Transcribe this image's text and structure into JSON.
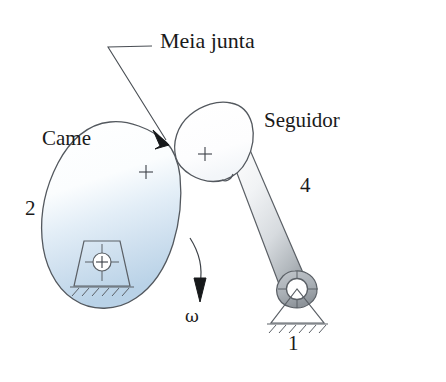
{
  "figure": {
    "background_color": "#ffffff",
    "outline_color": "#555a60",
    "text_color": "#1a1a1a"
  },
  "labels": {
    "half_joint": "Meia junta",
    "cam": "Came",
    "follower": "Seguidor",
    "link_cam_number": "2",
    "link_follower_number": "4",
    "link_ground_number": "1",
    "angular_velocity": "ω"
  },
  "parts": {
    "cam": {
      "name": "Came",
      "link_number": "2",
      "fill_top_color": "#ffffff",
      "fill_bottom_color": "#bcd3e8",
      "center_mark": "+"
    },
    "follower": {
      "name": "Seguidor",
      "link_number": "4",
      "head_fill_color": "#ffffff",
      "arm_fill_top_color": "#f2f4f6",
      "arm_fill_bottom_color": "#9aa0a6",
      "center_mark": "+"
    },
    "ground": {
      "name": "Ground",
      "link_number": "1",
      "support_type": "hatched-triangle-pivot"
    },
    "cam_pivot": {
      "support_type": "hatched-trapezoid-pivot",
      "center_mark": "+"
    },
    "half_joint": {
      "name": "Meia junta",
      "description": "contact point between cam and follower"
    },
    "rotation": {
      "symbol": "ω",
      "direction": "clockwise"
    }
  }
}
